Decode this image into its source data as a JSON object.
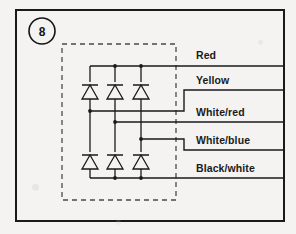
{
  "figure": {
    "badge_number": "8",
    "badge_shape": "circle",
    "frame_present": true,
    "dashed_enclosure_present": true
  },
  "colors": {
    "ink": "#1a1a1a",
    "paper": "#f4f3f1",
    "dashed": "#4a4a4a"
  },
  "diagram": {
    "type": "diode-bridge-schematic",
    "diode_count": 6,
    "column_count": 3,
    "diode_orientation": "anode-bottom-cathode-top",
    "wires": [
      {
        "id": "red",
        "label": "Red",
        "rail": "top",
        "source": "top-bus"
      },
      {
        "id": "yellow",
        "label": "Yellow",
        "rail": "step-up",
        "source": "column-1"
      },
      {
        "id": "white-red",
        "label": "White/red",
        "rail": "mid",
        "source": "column-2"
      },
      {
        "id": "white-blue",
        "label": "White/blue",
        "rail": "step-down",
        "source": "column-3"
      },
      {
        "id": "black-white",
        "label": "Black/white",
        "rail": "bottom",
        "source": "bottom-bus"
      }
    ]
  }
}
